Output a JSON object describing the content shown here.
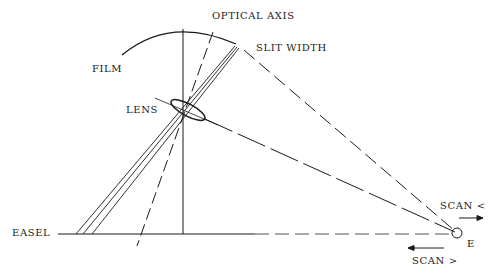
{
  "labels": {
    "optical_axis": "OPTICAL AXIS",
    "slit_width": "SLIT WIDTH",
    "film": "FILM",
    "lens": "LENS",
    "easel": "EASEL",
    "scan_left": "SCAN <",
    "scan_right": "SCAN >",
    "e": "E"
  },
  "colors": {
    "ink": "#1a1a1a",
    "background": "#ffffff"
  }
}
